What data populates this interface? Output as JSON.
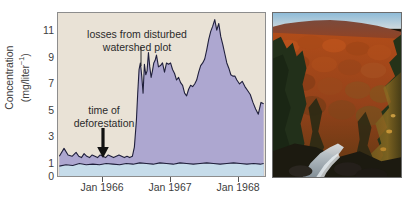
{
  "figure": {
    "background_color": "#ffffff"
  },
  "chart_data": {
    "type": "area",
    "title": "",
    "subtitle": "",
    "xlabel": "",
    "ylabel": "Concentration (mg/liter⁻¹)",
    "ylabel_line1": "Concentration",
    "ylabel_line2_prefix": "(mg/liter",
    "ylabel_line2_sup": "−1",
    "ylabel_line2_suffix": ")",
    "grid": false,
    "legend_position": "none",
    "plot_background_color": "#e9e2d6",
    "xlim": [
      1965.33,
      1968.42
    ],
    "ylim": [
      0,
      12.4
    ],
    "y_major_ticks": [
      0,
      1,
      3,
      5,
      7,
      9,
      11
    ],
    "y_minor_ticks": [
      2,
      4,
      6,
      8,
      10,
      12
    ],
    "y_tick_labels": [
      "0",
      "1",
      "3",
      "5",
      "7",
      "9",
      "11"
    ],
    "x_major_ticks": [
      1966.0,
      1967.0,
      1968.0
    ],
    "x_tick_labels": [
      "Jan 1966",
      "Jan 1967",
      "Jan 1968"
    ],
    "annotations": [
      {
        "name": "losses-from-disturbed-watershed-plot",
        "text_line1": "losses from disturbed",
        "text_line2": "watershed plot",
        "leader": "vertical-line",
        "points_to_x": 1966.62,
        "points_to_y": 9.4
      },
      {
        "name": "time-of-deforestation",
        "text_line1": "time of",
        "text_line2": "deforestation",
        "leader": "down-arrow",
        "points_to_x": 1966.06,
        "points_to_y": 1.6
      }
    ],
    "series": [
      {
        "name": "disturbed watershed plot",
        "fill_color": "#ada7d0",
        "line_color": "#20203c",
        "x": [
          1965.35,
          1965.42,
          1965.48,
          1965.54,
          1965.6,
          1965.64,
          1965.68,
          1965.72,
          1965.76,
          1965.8,
          1965.84,
          1965.88,
          1965.92,
          1965.96,
          1966.0,
          1966.04,
          1966.08,
          1966.12,
          1966.16,
          1966.2,
          1966.24,
          1966.28,
          1966.32,
          1966.36,
          1966.4,
          1966.44,
          1966.47,
          1966.5,
          1966.52,
          1966.54,
          1966.56,
          1966.58,
          1966.6,
          1966.62,
          1966.64,
          1966.66,
          1966.68,
          1966.7,
          1966.72,
          1966.74,
          1966.76,
          1966.78,
          1966.8,
          1966.83,
          1966.86,
          1966.89,
          1966.92,
          1966.95,
          1966.98,
          1967.01,
          1967.04,
          1967.07,
          1967.1,
          1967.13,
          1967.16,
          1967.19,
          1967.22,
          1967.25,
          1967.28,
          1967.31,
          1967.34,
          1967.37,
          1967.4,
          1967.43,
          1967.46,
          1967.49,
          1967.52,
          1967.55,
          1967.58,
          1967.61,
          1967.64,
          1967.67,
          1967.7,
          1967.73,
          1967.76,
          1967.79,
          1967.82,
          1967.85,
          1967.88,
          1967.91,
          1967.94,
          1967.97,
          1968.0,
          1968.04,
          1968.08,
          1968.12,
          1968.16,
          1968.2,
          1968.24,
          1968.28,
          1968.32,
          1968.36,
          1968.4
        ],
        "y": [
          1.5,
          2.1,
          1.6,
          1.5,
          1.8,
          1.5,
          1.4,
          1.7,
          1.5,
          1.4,
          1.6,
          1.5,
          1.4,
          1.6,
          1.5,
          1.4,
          1.6,
          1.5,
          1.4,
          1.5,
          1.6,
          1.5,
          1.4,
          1.5,
          1.4,
          1.5,
          2.2,
          4.2,
          6.3,
          8.1,
          8.6,
          7.6,
          6.3,
          8.5,
          7.7,
          8.0,
          9.4,
          8.3,
          7.5,
          8.0,
          8.6,
          8.8,
          9.2,
          8.3,
          8.4,
          8.6,
          7.9,
          8.6,
          8.5,
          8.6,
          8.1,
          7.8,
          7.3,
          7.5,
          7.1,
          6.9,
          6.3,
          6.1,
          6.6,
          6.9,
          6.8,
          7.0,
          7.3,
          7.9,
          8.4,
          8.6,
          8.9,
          9.6,
          10.4,
          11.0,
          11.4,
          11.9,
          11.1,
          11.6,
          10.6,
          10.0,
          9.3,
          8.6,
          8.2,
          7.7,
          7.6,
          7.6,
          7.3,
          7.0,
          7.2,
          6.8,
          6.5,
          6.2,
          5.6,
          5.1,
          4.7,
          5.6,
          5.5
        ]
      },
      {
        "name": "undisturbed reference",
        "fill_color": "#c6dcea",
        "line_color": "#20203c",
        "x": [
          1965.35,
          1965.45,
          1965.55,
          1965.65,
          1965.75,
          1965.85,
          1965.95,
          1966.05,
          1966.15,
          1966.25,
          1966.35,
          1966.45,
          1966.55,
          1966.65,
          1966.75,
          1966.85,
          1966.95,
          1967.05,
          1967.15,
          1967.25,
          1967.35,
          1967.45,
          1967.55,
          1967.65,
          1967.75,
          1967.85,
          1967.95,
          1968.05,
          1968.15,
          1968.25,
          1968.35,
          1968.4
        ],
        "y": [
          0.75,
          0.85,
          0.8,
          0.95,
          0.85,
          0.9,
          0.85,
          0.95,
          0.9,
          0.85,
          0.95,
          0.9,
          1.0,
          0.95,
          0.9,
          1.0,
          0.95,
          0.9,
          1.0,
          0.95,
          0.9,
          0.95,
          1.0,
          0.95,
          0.9,
          0.95,
          1.0,
          0.95,
          0.9,
          0.95,
          0.9,
          0.95
        ]
      }
    ]
  },
  "photo": {
    "name": "autumn-forest-stream-photo",
    "description": "Autumn hillside forest with orange and red foliage, dark conifers, and a stream in the ravine below",
    "sky_color": "#9dc3dc",
    "canopy_color": "#a84a1c",
    "conifer_color": "#22301a",
    "stream_color": "#c8d4dc"
  }
}
